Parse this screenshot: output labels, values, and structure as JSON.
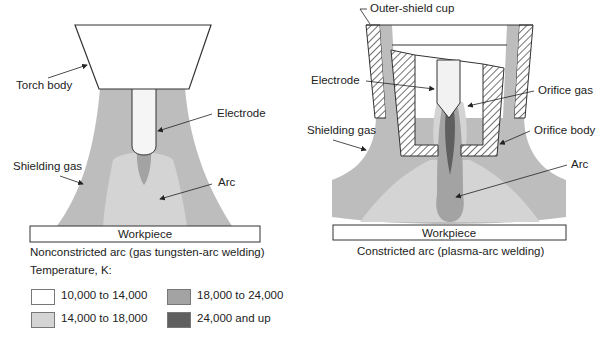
{
  "left_diagram": {
    "labels": {
      "torch_body": "Torch body",
      "electrode": "Electrode",
      "shielding_gas": "Shielding gas",
      "arc": "Arc",
      "workpiece": "Workpiece"
    },
    "caption": "Nonconstricted arc (gas tungsten-arc welding)"
  },
  "right_diagram": {
    "labels": {
      "outer_shield_cup": "Outer-shield cup",
      "electrode": "Electrode",
      "orifice_gas": "Orifice gas",
      "shielding_gas": "Shielding gas",
      "orifice_body": "Orifice body",
      "arc": "Arc",
      "workpiece": "Workpiece"
    },
    "caption": "Constricted arc (plasma-arc welding)"
  },
  "legend": {
    "title": "Temperature, K:",
    "items": [
      {
        "label": "10,000 to 14,000",
        "color": "#ffffff"
      },
      {
        "label": "14,000 to 18,000",
        "color": "#d4d4d4"
      },
      {
        "label": "18,000 to 24,000",
        "color": "#a3a3a3"
      },
      {
        "label": "24,000 and up",
        "color": "#5f5f5f"
      }
    ]
  },
  "colors": {
    "zone_10k": "#ffffff",
    "zone_14k": "#d4d4d4",
    "zone_18k": "#a3a3a3",
    "zone_24k": "#5f5f5f",
    "shielding": "#bdbdbd"
  }
}
